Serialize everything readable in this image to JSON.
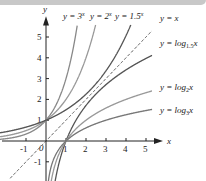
{
  "chart_data": {
    "type": "line",
    "title": "",
    "xlabel": "x",
    "ylabel": "y",
    "xlim": [
      -1.8,
      5.8
    ],
    "ylim": [
      -1.8,
      5.8
    ],
    "x_ticks": [
      "-1",
      "1",
      "2",
      "3",
      "4",
      "5"
    ],
    "y_ticks": [
      "-1",
      "1",
      "2",
      "3",
      "4",
      "5"
    ],
    "origin_label": "0",
    "series": [
      {
        "name": "y = 3^x",
        "label": "y = 3",
        "sup": "x",
        "func": "3^x",
        "color": "#888888"
      },
      {
        "name": "y = 2^x",
        "label": "y = 2",
        "sup": "x",
        "func": "2^x",
        "color": "#999999"
      },
      {
        "name": "y = 1.5^x",
        "label": "y = 1.5",
        "sup": "x",
        "func": "1.5^x",
        "color": "#555555"
      },
      {
        "name": "y = x",
        "label": "y = x",
        "func": "x",
        "color": "#333333",
        "dashed": true
      },
      {
        "name": "y = log1.5 x",
        "label": "y = log",
        "sub": "1.5",
        "tail": "x",
        "func": "log_1.5(x)",
        "color": "#555555"
      },
      {
        "name": "y = log2 x",
        "label": "y = log",
        "sub": "2",
        "tail": "x",
        "func": "log_2(x)",
        "color": "#999999"
      },
      {
        "name": "y = log3 x",
        "label": "y = log",
        "sub": "3",
        "tail": "x",
        "func": "log_3(x)",
        "color": "#777777"
      }
    ],
    "grid": false
  }
}
